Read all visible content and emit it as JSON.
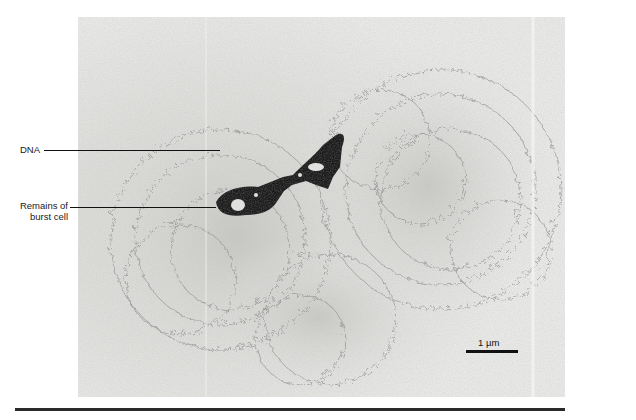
{
  "figure": {
    "type": "electron-micrograph",
    "labels": {
      "dna": "DNA",
      "remains_line1": "Remains of",
      "remains_line2": "burst cell"
    },
    "scale_bar": {
      "label": "1 µm"
    },
    "colors": {
      "background": "#ffffff",
      "micrograph_base": "#e4e4e2",
      "dna_strands": "#8a8a8a",
      "cell_remains": "#1c1c1c",
      "rule": "#2a2a2a"
    }
  }
}
